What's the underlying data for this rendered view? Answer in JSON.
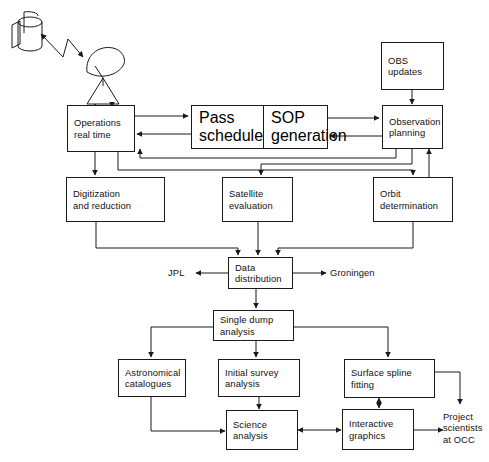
{
  "diagram": {
    "background_color": "#ffffff",
    "stroke_color": "#1a1a1a",
    "nodes": {
      "operations_real_time": {
        "line1": "Operations",
        "line2": "real time"
      },
      "pass_schedule": {
        "line1": "Pass",
        "line2": "schedule"
      },
      "sop_generation": {
        "line1": "SOP",
        "line2": "generation"
      },
      "obs_updates": {
        "line1": "OBS",
        "line2": "updates"
      },
      "observation_planning": {
        "line1": "Observation",
        "line2": "planning"
      },
      "digitization_and_reduction": {
        "line1": "Digitization",
        "line2": "and reduction"
      },
      "satellite_evaluation": {
        "line1": "Satellite",
        "line2": "evaluation"
      },
      "orbit_determination": {
        "line1": "Orbit",
        "line2": "determination"
      },
      "data_distribution": {
        "line1": "Data",
        "line2": "distribution"
      },
      "single_dump_analysis": {
        "line1": "Single dump",
        "line2": "analysis"
      },
      "astronomical_catalogues": {
        "line1": "Astronomical",
        "line2": "catalogues"
      },
      "initial_survey_analysis": {
        "line1": "Initial survey",
        "line2": "analysis"
      },
      "surface_spline_fitting": {
        "line1": "Surface spline",
        "line2": "fitting"
      },
      "science_analysis": {
        "line1": "Science",
        "line2": "analysis"
      },
      "interactive_graphics": {
        "line1": "Interactive",
        "line2": "graphics"
      }
    },
    "endpoint_labels": {
      "jpl": "JPL",
      "groningen": "Groningen",
      "project_scientists": {
        "line1": "Project",
        "line2": "scientists",
        "line3": "at OCC"
      }
    },
    "icons": {
      "spacecraft": "satellite-icon",
      "ground_station": "antenna-dish-icon",
      "radio_link": "radio-signal-icon"
    }
  }
}
